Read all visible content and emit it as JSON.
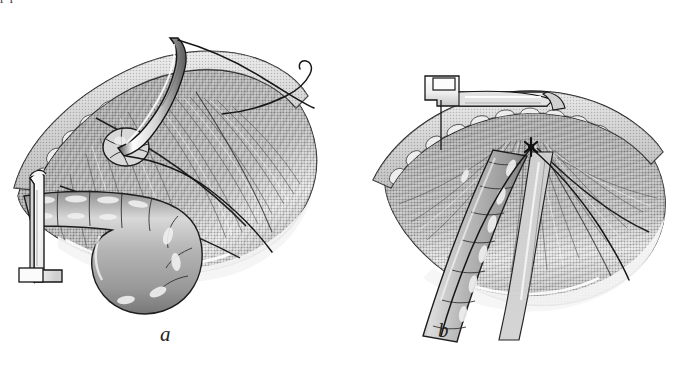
{
  "figure": {
    "kind": "surgical-illustration",
    "medium": "grayscale halftone pen-and-ink drawing",
    "background_color": "#ffffff",
    "ink_color": "#1a1a1a",
    "clipped_caption_above": "p                    p",
    "panels": [
      {
        "id": "a",
        "label": "a",
        "description": "Curved surgical needle with suture passed through the everted tissue edge; a hook retractor holds the wound margin on the left and the tubular cord structure is displaced inferiorly.",
        "structures": [
          {
            "name": "subcutaneous-fat-layer",
            "appearance": "cobblestone globules along the cut edge",
            "fill": "#c9c9c9"
          },
          {
            "name": "muscle-aponeurosis-flap",
            "appearance": "striated fan of fibers",
            "fill": "#8d8d8d"
          },
          {
            "name": "tubular-cord-structure",
            "appearance": "segmented tube curving inferiorly",
            "fill": "#b5b5b5"
          },
          {
            "name": "curved-surgical-needle",
            "appearance": "long tapered curved needle held vertically",
            "fill": "#f2f2f2"
          },
          {
            "name": "suture-thread",
            "appearance": "fine dark filaments trailing to the right with a curled free end",
            "fill": "#1a1a1a"
          },
          {
            "name": "hook-retractor",
            "appearance": "L-shaped right-angle retractor at left margin",
            "fill": "#fafafa"
          },
          {
            "name": "round-tissue-bundle",
            "appearance": "small round sectioned bundle at the needle entry point",
            "fill": "#d4d4d4"
          }
        ]
      },
      {
        "id": "b",
        "label": "b",
        "description": "Completed repair: the flat blade retractor lifts the fatty wound margin while the sutured cord structure lies in the reconstructed canal with the knot tied at the apex.",
        "structures": [
          {
            "name": "subcutaneous-fat-layer",
            "appearance": "cobblestone globules along the arched cut edge",
            "fill": "#c9c9c9"
          },
          {
            "name": "muscle-aponeurosis-flap",
            "appearance": "broad striated fan of fibers",
            "fill": "#8d8d8d"
          },
          {
            "name": "tubular-cord-structure",
            "appearance": "segmented tube descending to lower left",
            "fill": "#b5b5b5"
          },
          {
            "name": "blade-retractor",
            "appearance": "flat horizontal retractor blade with upturned handle",
            "fill": "#f2f2f2"
          },
          {
            "name": "suture-knot",
            "appearance": "dark knot point at the apex of the repair",
            "fill": "#1a1a1a"
          },
          {
            "name": "suture-line",
            "appearance": "dark line running along the repaired edge",
            "fill": "#1a1a1a"
          }
        ]
      }
    ]
  }
}
